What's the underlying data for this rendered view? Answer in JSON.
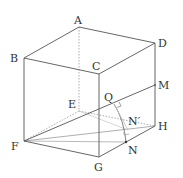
{
  "diagram": {
    "type": "cube-geometry",
    "vertices": {
      "A": {
        "label": "A",
        "x": 79,
        "y": 27,
        "lx": 74,
        "ly": 24
      },
      "B": {
        "label": "B",
        "x": 24,
        "y": 58,
        "lx": 10,
        "ly": 62
      },
      "C": {
        "label": "C",
        "x": 99,
        "y": 74,
        "lx": 92,
        "ly": 70
      },
      "D": {
        "label": "D",
        "x": 155,
        "y": 43,
        "lx": 158,
        "ly": 47
      },
      "E": {
        "label": "E",
        "x": 79,
        "y": 111,
        "lx": 68,
        "ly": 108
      },
      "F": {
        "label": "F",
        "x": 24,
        "y": 141,
        "lx": 11,
        "ly": 150
      },
      "G": {
        "label": "G",
        "x": 99,
        "y": 157,
        "lx": 94,
        "ly": 171
      },
      "H": {
        "label": "H",
        "x": 155,
        "y": 126,
        "lx": 158,
        "ly": 130
      },
      "M": {
        "label": "M",
        "x": 155,
        "y": 85,
        "lx": 158,
        "ly": 89
      },
      "Q": {
        "label": "Q",
        "x": 114,
        "y": 104,
        "lx": 104,
        "ly": 101
      },
      "N": {
        "label": "N",
        "x": 126,
        "y": 142,
        "lx": 128,
        "ly": 154
      },
      "Nprime": {
        "label": "N′",
        "x": 128,
        "y": 130,
        "lx": 128,
        "ly": 125
      }
    },
    "colors": {
      "edge": "#555555",
      "hidden": "#999999",
      "light": "#bbbbbb"
    }
  }
}
